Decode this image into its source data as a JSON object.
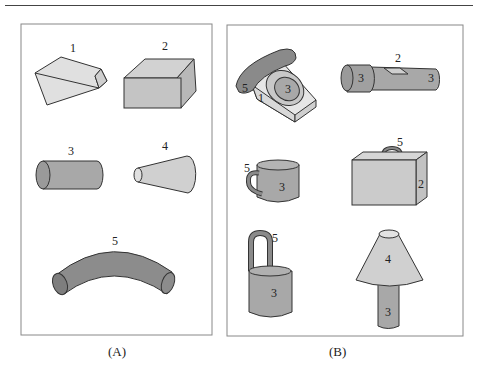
{
  "figure": {
    "panels": [
      {
        "id": "A",
        "caption": "(A)",
        "description": "Primitive shapes (geons)",
        "shapes": [
          {
            "label": "1",
            "shape": "wedge",
            "color": "#d9d9d9"
          },
          {
            "label": "2",
            "shape": "box",
            "color": "#c4c4c4"
          },
          {
            "label": "3",
            "shape": "cylinder",
            "color": "#a8a8a8"
          },
          {
            "label": "4",
            "shape": "cone",
            "color": "#cfcfcf"
          },
          {
            "label": "5",
            "shape": "curved-tube",
            "color": "#8c8c8c"
          }
        ]
      },
      {
        "id": "B",
        "caption": "(B)",
        "description": "Objects composed of primitives",
        "objects": [
          {
            "name": "telephone",
            "part_labels": [
              "5",
              "3",
              "1"
            ]
          },
          {
            "name": "flashlight",
            "part_labels": [
              "2",
              "3",
              "3"
            ]
          },
          {
            "name": "mug",
            "part_labels": [
              "5",
              "3"
            ]
          },
          {
            "name": "briefcase",
            "part_labels": [
              "5",
              "2"
            ]
          },
          {
            "name": "bucket",
            "part_labels": [
              "5",
              "3"
            ]
          },
          {
            "name": "lamp",
            "part_labels": [
              "4",
              "3"
            ]
          }
        ]
      }
    ]
  },
  "labels": {
    "a1": "1",
    "a2": "2",
    "a3": "3",
    "a4": "4",
    "a5": "5",
    "phone_handset": "5",
    "phone_dial": "3",
    "phone_base": "1",
    "flash_switch": "2",
    "flash_head": "3",
    "flash_body": "3",
    "mug_handle": "5",
    "mug_body": "3",
    "case_handle": "5",
    "case_body": "2",
    "bucket_handle": "5",
    "bucket_body": "3",
    "lamp_shade": "4",
    "lamp_base": "3",
    "capA": "(A)",
    "capB": "(B)"
  },
  "colors": {
    "light": "#dcdcdc",
    "mid": "#c0c0c0",
    "dark": "#a6a6a6",
    "darker": "#8a8a8a",
    "stroke": "#333333"
  }
}
